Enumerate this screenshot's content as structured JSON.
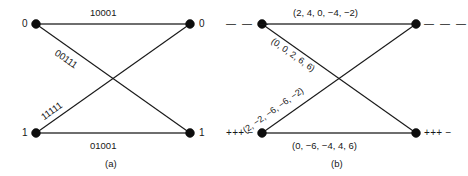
{
  "figure": {
    "panels": [
      {
        "id": "a",
        "caption": "(a)",
        "nodes": {
          "top_left_label": "0",
          "top_right_label": "0",
          "bottom_left_label": "1",
          "bottom_right_label": "1"
        },
        "edges": {
          "top": "10001",
          "bottom": "01001",
          "upper_diagonal": "00111",
          "lower_diagonal": "11111"
        }
      },
      {
        "id": "b",
        "caption": "(b)",
        "nodes": {
          "top_left_label": "— — —",
          "top_right_label": "— — —",
          "bottom_left_label": "+++ −",
          "bottom_right_label": "+++ −"
        },
        "edges": {
          "top": "(2, 4, 0, −4, −2)",
          "bottom": "(0, −6, −4, 4, 6)",
          "upper_diagonal": "(0, 0, 2, 6, 6)",
          "lower_diagonal": "(2, −2, −6, −6, −2)"
        }
      }
    ]
  }
}
